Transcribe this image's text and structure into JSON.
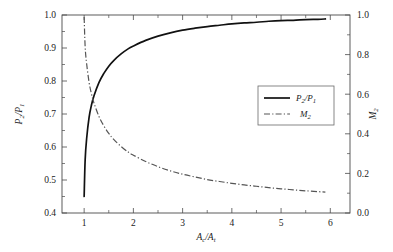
{
  "chart_data": {
    "type": "line",
    "title": "",
    "xlabel": "A_c/A_t",
    "xlabel_parts": {
      "main1": "A",
      "sub1": "c",
      "slash": "/",
      "main2": "A",
      "sub2": "t"
    },
    "ylabel_left": "P_2/P_1",
    "ylabel_left_parts": {
      "main1": "P",
      "sub1": "2",
      "slash": "/",
      "main2": "P",
      "sub2": "1"
    },
    "ylabel_right": "M_2",
    "ylabel_right_parts": {
      "main": "M",
      "sub": "2"
    },
    "xlim": [
      0.55,
      6.4
    ],
    "ylim_left": [
      0.4,
      1.0
    ],
    "ylim_right": [
      0.0,
      1.0
    ],
    "xticks": [
      "1",
      "2",
      "3",
      "4",
      "5",
      "6"
    ],
    "xtick_values": [
      1,
      2,
      3,
      4,
      5,
      6
    ],
    "yticks_left": [
      "1.0",
      "0.9",
      "0.8",
      "0.7",
      "0.6",
      "0.5",
      "0.4"
    ],
    "ytick_left_values": [
      1.0,
      0.9,
      0.8,
      0.7,
      0.6,
      0.5,
      0.4
    ],
    "yticks_right": [
      "1.0",
      "0.8",
      "0.6",
      "0.4",
      "0.2",
      "0.0"
    ],
    "ytick_right_values": [
      1.0,
      0.8,
      0.6,
      0.4,
      0.2,
      0.0
    ],
    "grid": false,
    "minor_ticks": true,
    "legend_position": "center-right",
    "legend_entries": [
      {
        "label": "P_2/P_1",
        "style": "solid",
        "color": "#111111"
      },
      {
        "label": "M_2",
        "style": "dashdot",
        "color": "#555555"
      }
    ],
    "series": [
      {
        "name": "P_2/P_1",
        "axis": "left",
        "style": "solid",
        "color": "#111111",
        "x": [
          1.0,
          1.02,
          1.05,
          1.1,
          1.15,
          1.2,
          1.3,
          1.4,
          1.5,
          1.6,
          1.75,
          1.9,
          2.0,
          2.25,
          2.5,
          2.75,
          3.0,
          3.25,
          3.5,
          3.75,
          4.0,
          4.25,
          4.5,
          4.75,
          5.0,
          5.25,
          5.5,
          5.75,
          5.9
        ],
        "y": [
          0.45,
          0.56,
          0.625,
          0.69,
          0.728,
          0.755,
          0.795,
          0.823,
          0.845,
          0.862,
          0.882,
          0.898,
          0.906,
          0.923,
          0.936,
          0.946,
          0.954,
          0.96,
          0.965,
          0.969,
          0.973,
          0.976,
          0.978,
          0.981,
          0.983,
          0.984,
          0.986,
          0.987,
          0.988
        ]
      },
      {
        "name": "M_2",
        "axis": "right",
        "style": "dashdot",
        "color": "#555555",
        "x": [
          1.0,
          1.02,
          1.05,
          1.1,
          1.15,
          1.2,
          1.3,
          1.4,
          1.5,
          1.6,
          1.75,
          1.9,
          2.0,
          2.25,
          2.5,
          2.75,
          3.0,
          3.25,
          3.5,
          3.75,
          4.0,
          4.25,
          4.5,
          4.75,
          5.0,
          5.25,
          5.5,
          5.75,
          5.9
        ],
        "y": [
          0.99,
          0.84,
          0.755,
          0.66,
          0.6,
          0.555,
          0.488,
          0.44,
          0.402,
          0.372,
          0.336,
          0.307,
          0.292,
          0.26,
          0.234,
          0.213,
          0.196,
          0.182,
          0.169,
          0.159,
          0.15,
          0.142,
          0.135,
          0.128,
          0.122,
          0.117,
          0.112,
          0.108,
          0.105
        ]
      }
    ]
  }
}
